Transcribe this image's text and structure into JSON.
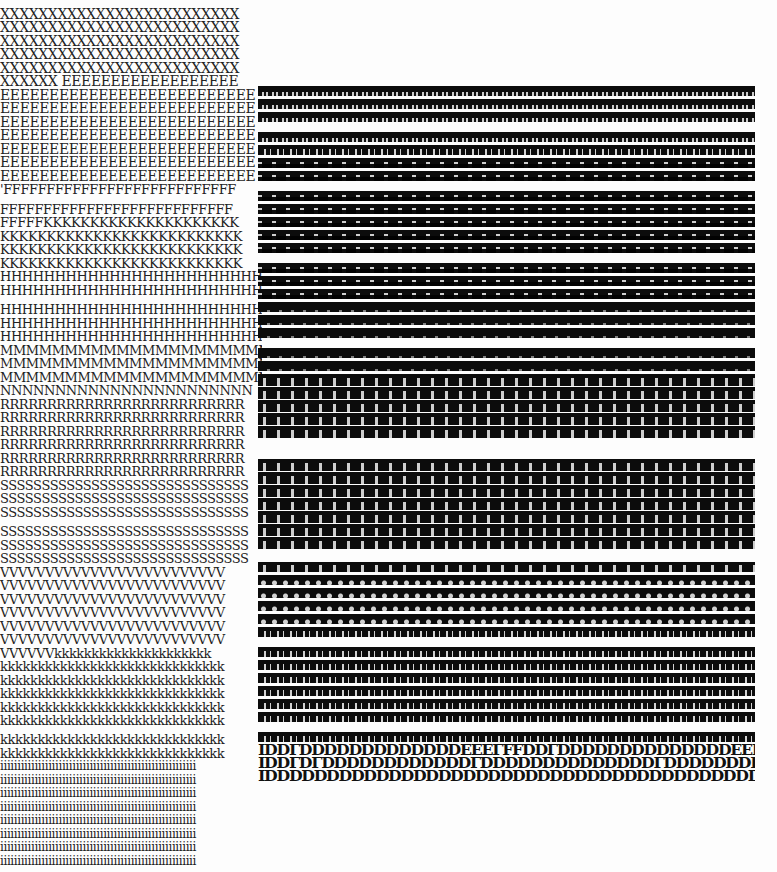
{
  "document": {
    "description": "Scanned typewriter print-quality test sheet",
    "background": "#fdfdfd",
    "ink": "#222222",
    "left_rows": [
      {
        "y": 8,
        "text": "XXXXXXXXXXXXXXXXXXXXXXXXX",
        "size": 14
      },
      {
        "y": 21,
        "text": "XXXXXXXXXXXXXXXXXXXXXXXXX",
        "size": 14
      },
      {
        "y": 35,
        "text": "XXXXXXXXXXXXXXXXXXXXXXXXX",
        "size": 14
      },
      {
        "y": 48,
        "text": "XXXXXXXXXXXXXXXXXXXXXXXXX",
        "size": 14
      },
      {
        "y": 62,
        "text": "XXXXXXXXXXXXXXXXXXXXXXXXX",
        "size": 14
      },
      {
        "y": 75,
        "text": "XXXXXX EEEEEEEEEEEEEEEEEE",
        "size": 14
      },
      {
        "y": 89,
        "text": "EEEEEEEEEEEEEEEEEEEEEEEEEE",
        "size": 14
      },
      {
        "y": 102,
        "text": "EEEEEEEEEEEEEEEEEEEEEEEEEE",
        "size": 14
      },
      {
        "y": 116,
        "text": "EEEEEEEEEEEEEEEEEEEEEEEEEE",
        "size": 14
      },
      {
        "y": 129,
        "text": "EEEEEEEEEEEEEEEEEEEEEEEEEE",
        "size": 14
      },
      {
        "y": 143,
        "text": "EEEEEEEEEEEEEEEEEEEEEEEEEE",
        "size": 14
      },
      {
        "y": 156,
        "text": "EEEEEEEEEEEEEEEEEEEEEEEEEE",
        "size": 14
      },
      {
        "y": 170,
        "text": "EEEEEEEEEEEEEEEEEEEEEEEEEE",
        "size": 14
      },
      {
        "y": 183,
        "text": "'FFFFFFFFFFFFFFFFFFFFFFFFFFF",
        "size": 13
      },
      {
        "y": 203,
        "text": "FFFFFFFFFFFFFFFFFFFFFFFFFFF",
        "size": 13
      },
      {
        "y": 216,
        "text": "FFFFFKKKKKKKKKKKKKKKKKKKKK",
        "size": 13
      },
      {
        "y": 230,
        "text": "KKKKKKKKKKKKKKKKKKKKKKKKKK",
        "size": 13
      },
      {
        "y": 243,
        "text": "KKKKKKKKKKKKKKKKKKKKKKKKKK",
        "size": 13
      },
      {
        "y": 257,
        "text": "KKKKKKKKKKKKKKKKKKKKKKKKKK",
        "size": 13
      },
      {
        "y": 270,
        "text": "HHHHHHHHHHHHHHHHHHHHHHHHH",
        "size": 13
      },
      {
        "y": 284,
        "text": "HHHHHHHHHHHHHHHHHHHHHHHHH",
        "size": 13
      },
      {
        "y": 303,
        "text": "HHHHHHHHHHHHHHHHHHHHHHHHH",
        "size": 13
      },
      {
        "y": 317,
        "text": "HHHHHHHHHHHHHHHHHHHHHHHHH",
        "size": 13
      },
      {
        "y": 330,
        "text": "HHHHHHHHHHHHHHHHHHHHHHHHH",
        "size": 13
      },
      {
        "y": 344,
        "text": "MMMMMMMMMMMMMMMMMMMMMM",
        "size": 13
      },
      {
        "y": 357,
        "text": "MMMMMMMMMMMMMMMMMMMMMM",
        "size": 13
      },
      {
        "y": 371,
        "text": "MMMMMMMMMMMMMMMMMMMMMM",
        "size": 13
      },
      {
        "y": 384,
        "text": "NNNNNNNNNNNNNNNNNNNNNNN",
        "size": 13
      },
      {
        "y": 398,
        "text": "RRRRRRRRRRRRRRRRRRRRRRRRRR",
        "size": 13
      },
      {
        "y": 411,
        "text": "RRRRRRRRRRRRRRRRRRRRRRRRRR",
        "size": 13
      },
      {
        "y": 425,
        "text": "RRRRRRRRRRRRRRRRRRRRRRRRRR",
        "size": 13
      },
      {
        "y": 438,
        "text": "RRRRRRRRRRRRRRRRRRRRRRRRRR",
        "size": 13
      },
      {
        "y": 452,
        "text": "RRRRRRRRRRRRRRRRRRRRRRRRRR",
        "size": 13
      },
      {
        "y": 465,
        "text": "RRRRRRRRRRRRRRRRRRRRRRRRRR",
        "size": 13
      },
      {
        "y": 479,
        "text": "SSSSSSSSSSSSSSSSSSSSSSSSSSSSSS",
        "size": 13
      },
      {
        "y": 492,
        "text": "SSSSSSSSSSSSSSSSSSSSSSSSSSSSSS",
        "size": 13
      },
      {
        "y": 506,
        "text": "SSSSSSSSSSSSSSSSSSSSSSSSSSSSSS",
        "size": 13
      },
      {
        "y": 525,
        "text": "SSSSSSSSSSSSSSSSSSSSSSSSSSSSSS",
        "size": 13
      },
      {
        "y": 539,
        "text": "SSSSSSSSSSSSSSSSSSSSSSSSSSSSSS",
        "size": 13
      },
      {
        "y": 552,
        "text": "SSSSSSSSSSSSSSSSSSSSSSSSSSSSSS",
        "size": 13
      },
      {
        "y": 566,
        "text": "VVVVVVVVVVVVVVVVVVVVVVVVV",
        "size": 13
      },
      {
        "y": 579,
        "text": "VVVVVVVVVVVVVVVVVVVVVVVVV",
        "size": 13
      },
      {
        "y": 593,
        "text": "VVVVVVVVVVVVVVVVVVVVVVVVV",
        "size": 13
      },
      {
        "y": 606,
        "text": "VVVVVVVVVVVVVVVVVVVVVVVVV",
        "size": 13
      },
      {
        "y": 620,
        "text": "VVVVVVVVVVVVVVVVVVVVVVVVV",
        "size": 13
      },
      {
        "y": 633,
        "text": "VVVVVVVVVVVVVVVVVVVVVVVVV",
        "size": 13
      },
      {
        "y": 647,
        "text": "VVVVVVkkkkkkkkkkkkkkkkkkkkk",
        "size": 13
      },
      {
        "y": 660,
        "text": "kkkkkkkkkkkkkkkkkkkkkkkkkkkkkk",
        "size": 13
      },
      {
        "y": 674,
        "text": "kkkkkkkkkkkkkkkkkkkkkkkkkkkkkk",
        "size": 13
      },
      {
        "y": 687,
        "text": "kkkkkkkkkkkkkkkkkkkkkkkkkkkkkk",
        "size": 13
      },
      {
        "y": 701,
        "text": "kkkkkkkkkkkkkkkkkkkkkkkkkkkkkk",
        "size": 13
      },
      {
        "y": 714,
        "text": "kkkkkkkkkkkkkkkkkkkkkkkkkkkkkk",
        "size": 13
      },
      {
        "y": 733,
        "text": "kkkkkkkkkkkkkkkkkkkkkkkkkkkkkk",
        "size": 13
      },
      {
        "y": 747,
        "text": "kkkkkkkkkkkkkkkkkkkkkkkkkkkkkk",
        "size": 13
      },
      {
        "y": 760,
        "text": "iiiiiiiiiiiiiiiiiiiiiiiiiiiiiiiiiiiiiiiiiiiiiiiiiiiiiiiii",
        "size": 12
      },
      {
        "y": 774,
        "text": "iiiiiiiiiiiiiiiiiiiiiiiiiiiiiiiiiiiiiiiiiiiiiiiiiiiiiiiii",
        "size": 12
      },
      {
        "y": 787,
        "text": "iiiiiiiiiiiiiiiiiiiiiiiiiiiiiiiiiiiiiiiiiiiiiiiiiiiiiiiii",
        "size": 12
      },
      {
        "y": 801,
        "text": "iiiiiiiiiiiiiiiiiiiiiiiiiiiiiiiiiiiiiiiiiiiiiiiiiiiiiiiii",
        "size": 12
      },
      {
        "y": 814,
        "text": "iiiiiiiiiiiiiiiiiiiiiiiiiiiiiiiiiiiiiiiiiiiiiiiiiiiiiiiii",
        "size": 12
      },
      {
        "y": 828,
        "text": "iiiiiiiiiiiiiiiiiiiiiiiiiiiiiiiiiiiiiiiiiiiiiiiiiiiiiiiii",
        "size": 12
      },
      {
        "y": 841,
        "text": "iiiiiiiiiiiiiiiiiiiiiiiiiiiiiiiiiiiiiiiiiiiiiiiiiiiiiiiii",
        "size": 12
      },
      {
        "y": 855,
        "text": "iiiiiiiiiiiiiiiiiiiiiiiiiiiiiiiiiiiiiiiiiiiiiiiiiiiiiiiii",
        "size": 12
      }
    ],
    "right_block": {
      "x": 258,
      "y": 86,
      "width": 497,
      "strips": [
        {
          "y": 0,
          "h": 10,
          "style": "t-light"
        },
        {
          "y": 13,
          "h": 10,
          "style": "t-light"
        },
        {
          "y": 26,
          "h": 10,
          "style": "t-light"
        },
        {
          "y": 46,
          "h": 10,
          "style": "t-light"
        },
        {
          "y": 59,
          "h": 10,
          "style": "t-glyph"
        },
        {
          "y": 72,
          "h": 10,
          "style": "t-spike"
        },
        {
          "y": 85,
          "h": 10,
          "style": "t-spike"
        },
        {
          "y": 105,
          "h": 10,
          "style": "t-spike"
        },
        {
          "y": 118,
          "h": 10,
          "style": "t-spike"
        },
        {
          "y": 131,
          "h": 10,
          "style": "t-spike"
        },
        {
          "y": 144,
          "h": 10,
          "style": "t-spike"
        },
        {
          "y": 157,
          "h": 10,
          "style": "t-spike"
        },
        {
          "y": 177,
          "h": 10,
          "style": "t-spike"
        },
        {
          "y": 190,
          "h": 10,
          "style": "t-spike"
        },
        {
          "y": 203,
          "h": 10,
          "style": "t-spike"
        },
        {
          "y": 216,
          "h": 10,
          "style": "t-solid"
        },
        {
          "y": 229,
          "h": 10,
          "style": "t-solid"
        },
        {
          "y": 242,
          "h": 10,
          "style": "t-solid"
        },
        {
          "y": 262,
          "h": 10,
          "style": "t-solid"
        },
        {
          "y": 275,
          "h": 10,
          "style": "t-solid"
        },
        {
          "y": 288,
          "h": 12,
          "style": "t-cells"
        },
        {
          "y": 301,
          "h": 12,
          "style": "t-cells"
        },
        {
          "y": 314,
          "h": 12,
          "style": "t-cells"
        },
        {
          "y": 327,
          "h": 12,
          "style": "t-cells"
        },
        {
          "y": 340,
          "h": 12,
          "style": "t-cells"
        },
        {
          "y": 373,
          "h": 12,
          "style": "t-cells"
        },
        {
          "y": 386,
          "h": 12,
          "style": "t-cells"
        },
        {
          "y": 399,
          "h": 12,
          "style": "t-cells"
        },
        {
          "y": 412,
          "h": 12,
          "style": "t-cells"
        },
        {
          "y": 425,
          "h": 12,
          "style": "t-cells"
        },
        {
          "y": 438,
          "h": 12,
          "style": "t-cells"
        },
        {
          "y": 451,
          "h": 12,
          "style": "t-cells"
        },
        {
          "y": 476,
          "h": 10,
          "style": "t-cells"
        },
        {
          "y": 489,
          "h": 10,
          "style": "t-rings"
        },
        {
          "y": 502,
          "h": 10,
          "style": "t-rings"
        },
        {
          "y": 515,
          "h": 10,
          "style": "t-rings"
        },
        {
          "y": 528,
          "h": 10,
          "style": "t-rings"
        },
        {
          "y": 541,
          "h": 10,
          "style": "t-glyph"
        },
        {
          "y": 561,
          "h": 10,
          "style": "t-glyph"
        },
        {
          "y": 574,
          "h": 10,
          "style": "t-glyph"
        },
        {
          "y": 587,
          "h": 10,
          "style": "t-glyph"
        },
        {
          "y": 600,
          "h": 10,
          "style": "t-glyph"
        },
        {
          "y": 613,
          "h": 10,
          "style": "t-glyph"
        },
        {
          "y": 626,
          "h": 10,
          "style": "t-glyph"
        },
        {
          "y": 646,
          "h": 10,
          "style": "t-glyph"
        }
      ],
      "d_rows": [
        {
          "y": 658,
          "text": "IDDΓDDDDDDDDDDDDDEEEΓFFDDΓDDDDDDDDDDDDDDEEEΓFFFFFE"
        },
        {
          "y": 671,
          "text": "IDDΓDΓDDDDDDDDDDDDΓDDDDDDDDDDDDDDΓDDDDDDDDDDDΓDDDD"
        },
        {
          "y": 684,
          "text": "IDDDDDDDDDDDDDDDDDDDDDDDDDDDDDDDDDDDDDDDDDDDDDDDDD"
        }
      ]
    }
  }
}
